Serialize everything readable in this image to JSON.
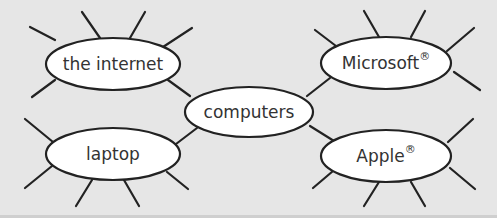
{
  "diagram": {
    "type": "mind-map",
    "background_color": "#e6e6e6",
    "line_color": "#222222",
    "node_fill": "#ffffff",
    "text_color": "#333333",
    "center_node": {
      "id": "computers",
      "label": "computers",
      "cx": 249,
      "cy": 112,
      "rx": 64,
      "ry": 25
    },
    "nodes": [
      {
        "id": "the-internet",
        "label": "the internet",
        "sup": "",
        "cx": 113,
        "cy": 64,
        "rx": 67,
        "ry": 26,
        "link": [
          168,
          80,
          190,
          96
        ],
        "spokes": [
          [
            55,
            40,
            30,
            27
          ],
          [
            100,
            38,
            82,
            12
          ],
          [
            130,
            38,
            145,
            12
          ],
          [
            163,
            47,
            192,
            28
          ],
          [
            55,
            80,
            32,
            97
          ]
        ]
      },
      {
        "id": "microsoft",
        "label": "Microsoft",
        "sup": "®",
        "cx": 386,
        "cy": 63,
        "rx": 65,
        "ry": 26,
        "link": [
          330,
          78,
          307,
          96
        ],
        "spokes": [
          [
            336,
            46,
            315,
            30
          ],
          [
            379,
            37,
            364,
            11
          ],
          [
            411,
            37,
            425,
            11
          ],
          [
            447,
            51,
            474,
            28
          ],
          [
            454,
            72,
            480,
            90
          ]
        ]
      },
      {
        "id": "laptop",
        "label": "laptop",
        "sup": "",
        "cx": 113,
        "cy": 154,
        "rx": 67,
        "ry": 26,
        "link": [
          176,
          144,
          197,
          128
        ],
        "spokes": [
          [
            53,
            142,
            25,
            119
          ],
          [
            52,
            166,
            25,
            188
          ],
          [
            92,
            180,
            76,
            206
          ],
          [
            124,
            180,
            139,
            206
          ],
          [
            167,
            172,
            188,
            189
          ]
        ]
      },
      {
        "id": "apple",
        "label": "Apple",
        "sup": "®",
        "cx": 386,
        "cy": 156,
        "rx": 65,
        "ry": 26,
        "link": [
          334,
          141,
          310,
          126
        ],
        "spokes": [
          [
            333,
            171,
            313,
            188
          ],
          [
            379,
            182,
            364,
            206
          ],
          [
            411,
            182,
            425,
            206
          ],
          [
            448,
            142,
            473,
            119
          ],
          [
            450,
            168,
            475,
            189
          ]
        ]
      }
    ]
  }
}
